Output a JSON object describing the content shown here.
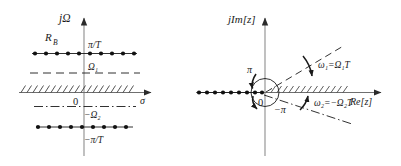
{
  "figure": {
    "background": "#ffffff",
    "ink": "#1a1a1a"
  },
  "left_plane": {
    "name": "s-plane",
    "axes": {
      "vertical_label": "jΩ",
      "horizontal_label": "σ",
      "origin_label": "0"
    },
    "region_label": "R_B",
    "region_label_main": "R",
    "region_label_sub": "B",
    "lines": [
      {
        "id": "upper-pi-over-T",
        "label": "π/T",
        "style": "dotted-markers",
        "y_value": "+π/T"
      },
      {
        "id": "omega-1",
        "label": "Ω₁",
        "style": "dashed",
        "y_value": "Ω₁"
      },
      {
        "id": "sigma-axis",
        "label": "σ",
        "style": "solid-hatched",
        "y_value": "0"
      },
      {
        "id": "minus-omega-2",
        "label": "−Ω₂",
        "style": "dash-dot",
        "y_value": "−Ω₂"
      },
      {
        "id": "lower-pi-over-T",
        "label": "−π/T",
        "style": "dotted-markers",
        "y_value": "−π/T"
      }
    ],
    "marker_count_per_line": 10
  },
  "right_plane": {
    "name": "z-plane",
    "axes": {
      "vertical_label": "jIm[z]",
      "horizontal_label": "Re[z]",
      "origin_label": "0"
    },
    "circle_labels": {
      "upper": "π",
      "lower": "−π"
    },
    "rays": [
      {
        "id": "omega-1-ray",
        "label": "ω₁=Ω₁T",
        "style": "dashed",
        "angle_deg": 33
      },
      {
        "id": "omega-2-ray",
        "label": "ω₂=−Ω₂T",
        "style": "dash-dot",
        "angle_deg": -20
      },
      {
        "id": "pi-ray",
        "label": "π",
        "style": "dotted-markers",
        "angle_deg": 180
      }
    ],
    "marker_count_neg_axis": 10,
    "unit_circle": {
      "label": "unit-circle",
      "radius_px": 14
    }
  }
}
